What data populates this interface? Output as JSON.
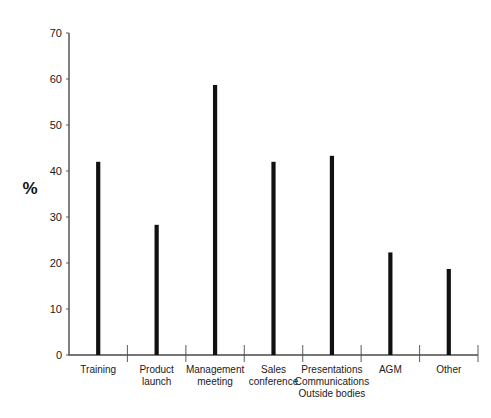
{
  "chart_data": {
    "type": "bar",
    "title": "",
    "subtitle": "",
    "xlabel": "",
    "ylabel": "%",
    "ylim": [
      0,
      70
    ],
    "y_ticks": [
      0,
      10,
      20,
      30,
      40,
      50,
      60,
      70
    ],
    "y_tick_labels": [
      "0",
      "10",
      "20",
      "30",
      "40",
      "50",
      "60",
      "70"
    ],
    "grid": false,
    "legend": "none",
    "categories": [
      "Training",
      "Product launch",
      "Management meeting",
      "Sales conference",
      "Presentations Communications Outside bodies",
      "AGM",
      "Other"
    ],
    "category_label_lines": [
      [
        "Training"
      ],
      [
        "Product",
        "launch"
      ],
      [
        "Management",
        "meeting"
      ],
      [
        "Sales",
        "conference"
      ],
      [
        "Presentations",
        "Communications",
        "Outside bodies"
      ],
      [
        "AGM"
      ],
      [
        "Other"
      ]
    ],
    "values": [
      42,
      28.3,
      58.7,
      42,
      43.3,
      22.3,
      18.7
    ],
    "bar_color": "#111111",
    "axis_color": "#4a4a4a"
  },
  "axis": {
    "y_title": "%"
  }
}
